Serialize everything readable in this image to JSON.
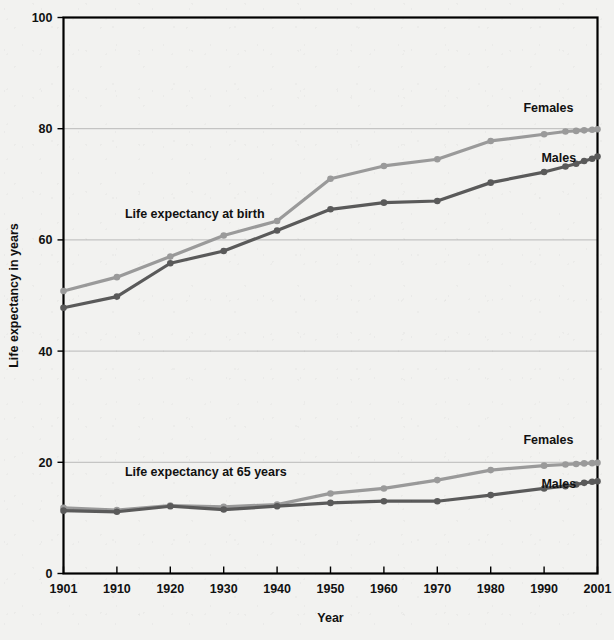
{
  "chart_data": {
    "type": "line",
    "title": "",
    "xlabel": "Year",
    "ylabel": "Life expectancy in years",
    "xlim": [
      0,
      10
    ],
    "ylim": [
      0,
      100
    ],
    "grid": true,
    "legend_position": "inline-right-end",
    "x_tick_labels": [
      "1901",
      "1910",
      "1920",
      "1930",
      "1940",
      "1950",
      "1960",
      "1970",
      "1980",
      "1990",
      "2001"
    ],
    "y_tick_labels": [
      "0",
      "20",
      "40",
      "60",
      "80",
      "100"
    ],
    "y_ticks": [
      0,
      20,
      40,
      60,
      80,
      100
    ],
    "annotations": [
      {
        "text": "Life expectancy at birth",
        "x_index": 1.15,
        "y_value": 64.0
      },
      {
        "text": "Life expectancy at 65 years",
        "x_index": 1.15,
        "y_value": 17.6
      }
    ],
    "groups": [
      {
        "name": "Life expectancy at birth",
        "series": [
          {
            "name": "Females",
            "color": "#9a9a9a",
            "label": "Females",
            "label_x_index": 9.55,
            "label_y_value": 83.0,
            "categories": [
              "1901",
              "1910",
              "1920",
              "1930",
              "1940",
              "1950",
              "1960",
              "1970",
              "1980",
              "1990",
              "2001"
            ],
            "values": [
              50.8,
              53.3,
              57.0,
              60.8,
              63.4,
              71.0,
              73.3,
              74.5,
              77.8,
              79.0,
              79.9
            ],
            "dense_tail": [
              {
                "x_index": 9.4,
                "value": 79.5
              },
              {
                "x_index": 9.6,
                "value": 79.6
              },
              {
                "x_index": 9.75,
                "value": 79.7
              },
              {
                "x_index": 9.9,
                "value": 79.8
              }
            ]
          },
          {
            "name": "Males",
            "color": "#5a5a5a",
            "label": "Males",
            "label_x_index": 9.6,
            "label_y_value": 74.0,
            "categories": [
              "1901",
              "1910",
              "1920",
              "1930",
              "1940",
              "1950",
              "1960",
              "1970",
              "1980",
              "1990",
              "2001"
            ],
            "values": [
              47.8,
              49.8,
              55.8,
              58.0,
              61.7,
              65.5,
              66.7,
              67.0,
              70.3,
              72.2,
              75.0
            ],
            "dense_tail": [
              {
                "x_index": 9.4,
                "value": 73.2
              },
              {
                "x_index": 9.6,
                "value": 73.7
              },
              {
                "x_index": 9.75,
                "value": 74.2
              },
              {
                "x_index": 9.9,
                "value": 74.6
              }
            ]
          }
        ]
      },
      {
        "name": "Life expectancy at 65 years",
        "series": [
          {
            "name": "Females",
            "color": "#9a9a9a",
            "label": "Females",
            "label_x_index": 9.55,
            "label_y_value": 23.3,
            "categories": [
              "1901",
              "1910",
              "1920",
              "1930",
              "1940",
              "1950",
              "1960",
              "1970",
              "1980",
              "1990",
              "2001"
            ],
            "values": [
              11.8,
              11.4,
              12.2,
              12.0,
              12.4,
              14.4,
              15.3,
              16.8,
              18.6,
              19.4,
              19.9
            ],
            "dense_tail": [
              {
                "x_index": 9.4,
                "value": 19.6
              },
              {
                "x_index": 9.6,
                "value": 19.7
              },
              {
                "x_index": 9.75,
                "value": 19.8
              },
              {
                "x_index": 9.9,
                "value": 19.85
              }
            ]
          },
          {
            "name": "Males",
            "color": "#5a5a5a",
            "label": "Males",
            "label_x_index": 9.6,
            "label_y_value": 15.4,
            "categories": [
              "1901",
              "1910",
              "1920",
              "1930",
              "1940",
              "1950",
              "1960",
              "1970",
              "1980",
              "1990",
              "2001"
            ],
            "values": [
              11.3,
              11.1,
              12.1,
              11.5,
              12.1,
              12.7,
              13.0,
              13.0,
              14.1,
              15.3,
              16.6
            ],
            "dense_tail": [
              {
                "x_index": 9.4,
                "value": 15.7
              },
              {
                "x_index": 9.6,
                "value": 16.0
              },
              {
                "x_index": 9.75,
                "value": 16.3
              },
              {
                "x_index": 9.9,
                "value": 16.5
              }
            ]
          }
        ]
      }
    ]
  },
  "figure": {
    "background_color": "#f2f2f0",
    "frame_color": "#000000",
    "grid_color": "#b9b9b9",
    "text_color": "#111111"
  }
}
